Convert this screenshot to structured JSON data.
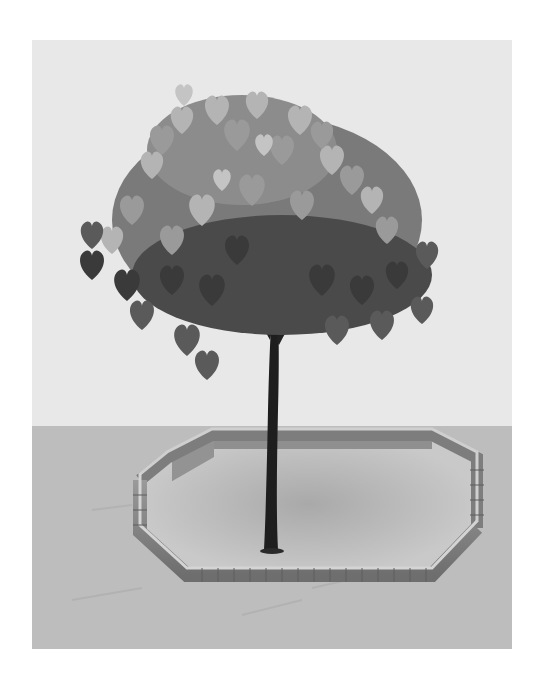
{
  "image": {
    "subject": "tree in octagonal log-edged planting bed",
    "style": "grayscale illustration",
    "frame": {
      "x": 32,
      "y": 40,
      "width": 480,
      "height": 609
    },
    "colors": {
      "page_background": "#ffffff",
      "sky": "#e8e8e8",
      "ground": "#bdbdbd",
      "bed_interior": "#c9c9c9",
      "log_side": "#8c8c8c",
      "log_top": "#cfcfcf",
      "trunk": "#1e1e1e",
      "leaf_light": "#b8b8b8",
      "leaf_mid": "#8a8a8a",
      "leaf_dark": "#3a3a3a"
    },
    "elements": [
      {
        "name": "sky-backdrop"
      },
      {
        "name": "ground-plane"
      },
      {
        "name": "tree-canopy",
        "leaf_shape": "heart"
      },
      {
        "name": "tree-trunk"
      },
      {
        "name": "log-border",
        "shape": "octagon"
      }
    ]
  }
}
